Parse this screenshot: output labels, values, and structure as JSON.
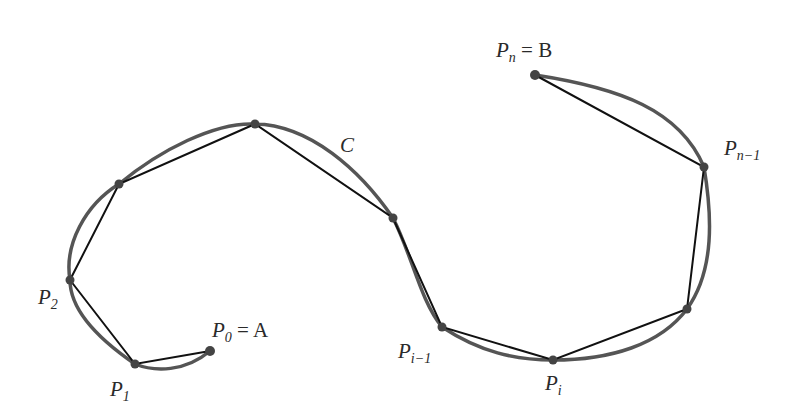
{
  "diagram": {
    "curve_label": "C",
    "colors": {
      "curve": "#555555",
      "polygon": "#111111",
      "point": "#444444",
      "text": "#2a2a2a"
    },
    "points": [
      {
        "id": "P0",
        "x": 210,
        "y": 351,
        "label": "P",
        "sub": "0",
        "suffix": " = A"
      },
      {
        "id": "P1",
        "x": 135,
        "y": 364,
        "label": "P",
        "sub": "1",
        "suffix": ""
      },
      {
        "id": "P2",
        "x": 70,
        "y": 280,
        "label": "P",
        "sub": "2",
        "suffix": ""
      },
      {
        "id": "P3",
        "x": 119,
        "y": 184
      },
      {
        "id": "P4",
        "x": 255,
        "y": 124
      },
      {
        "id": "P5",
        "x": 393,
        "y": 218
      },
      {
        "id": "Pi-1",
        "x": 442,
        "y": 327,
        "label": "P",
        "sub": "i−1",
        "suffix": ""
      },
      {
        "id": "Pi",
        "x": 553,
        "y": 360,
        "label": "P",
        "sub": "i",
        "suffix": ""
      },
      {
        "id": "Pn-2",
        "x": 687,
        "y": 309
      },
      {
        "id": "Pn-1",
        "x": 704,
        "y": 167,
        "label": "P",
        "sub": "n−1",
        "suffix": ""
      },
      {
        "id": "Pn",
        "x": 535,
        "y": 75,
        "label": "P",
        "sub": "n",
        "suffix": " = B"
      }
    ],
    "labels": {
      "p0": {
        "main": "P",
        "sub": "0",
        "rest": " = A"
      },
      "p1": {
        "main": "P",
        "sub": "1"
      },
      "p2": {
        "main": "P",
        "sub": "2"
      },
      "pim1": {
        "main": "P",
        "sub": "i−1"
      },
      "pi": {
        "main": "P",
        "sub": "i"
      },
      "pnm1": {
        "main": "P",
        "sub": "n−1"
      },
      "pn": {
        "main": "P",
        "sub": "n",
        "rest": " = B"
      },
      "c": "C"
    }
  }
}
